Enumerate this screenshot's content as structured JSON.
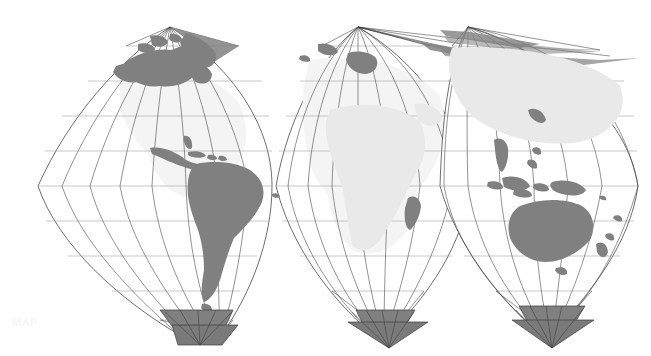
{
  "document": {
    "title": "World map — interrupted globular gore projection",
    "kind": "map",
    "background_color": "#ffffff"
  },
  "canvas": {
    "width": 651,
    "height": 356
  },
  "style": {
    "land_color": "#808080",
    "land_faint_color": "#e9e9e9",
    "graticule_color": "#4a4a4a",
    "graticule_faint_color": "#9a9a9a",
    "outline_color": "#3c3c3c",
    "polar_cap_color": "#808080",
    "watermark_color": "#f6f6f6"
  },
  "watermark": {
    "text": "MAP"
  },
  "projection": {
    "name": "interrupted gore / polyconic",
    "lobe_count": 3,
    "north_pole_shape": "point",
    "south_pole_shape": "triangular fan",
    "parallel_spacing_px": 35,
    "meridian_count_per_lobe": 7
  },
  "lobes": [
    {
      "id": "lobe-americas",
      "label": "Americas",
      "north_apex": {
        "x": 170,
        "y": 27
      },
      "south_apex": {
        "x": 222,
        "y": 334
      },
      "equator_y": 186,
      "left_x": 38,
      "right_x": 272,
      "features": [
        "North America",
        "Greenland",
        "Central America",
        "Caribbean",
        "South America",
        "Antarctic Peninsula"
      ]
    },
    {
      "id": "lobe-africa-europe",
      "label": "Africa / Europe",
      "north_apex": {
        "x": 358,
        "y": 27
      },
      "south_apex": {
        "x": 389,
        "y": 334
      },
      "equator_y": 186,
      "left_x": 276,
      "right_x": 470,
      "features": [
        "Europe",
        "Africa",
        "Madagascar",
        "Antarctica"
      ]
    },
    {
      "id": "lobe-asia-australia",
      "label": "Asia / Australia",
      "north_apex": {
        "x": 468,
        "y": 27
      },
      "south_apex": {
        "x": 552,
        "y": 334
      },
      "equator_y": 186,
      "left_x": 440,
      "right_x": 638,
      "features": [
        "Asia",
        "Indonesia",
        "New Guinea",
        "Australia",
        "New Zealand",
        "Antarctica"
      ]
    }
  ],
  "graticule": {
    "parallel_labels": [
      "80N",
      "60N",
      "40N",
      "20N",
      "0",
      "20S",
      "40S",
      "60S",
      "80S"
    ],
    "parallels_y": [
      46,
      81,
      116,
      151,
      186,
      221,
      256,
      291,
      320
    ],
    "shown": true
  }
}
